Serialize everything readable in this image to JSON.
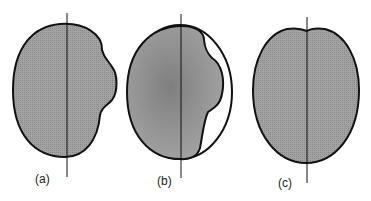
{
  "figure": {
    "panels": [
      {
        "id": "a",
        "label": "(a)",
        "description": "Shaded blob with right-side bulge, vertical axis line"
      },
      {
        "id": "b",
        "label": "(b)",
        "description": "Shaded blob with bulge enclosed by outer ellipse outline, vertical axis line"
      },
      {
        "id": "c",
        "label": "(c)",
        "description": "Shaded symmetric oval with small top notch, vertical axis line"
      }
    ],
    "colors": {
      "fill": "#9a9a9a",
      "fill_dark": "#858585",
      "stroke": "#111111",
      "background": "#ffffff"
    }
  }
}
